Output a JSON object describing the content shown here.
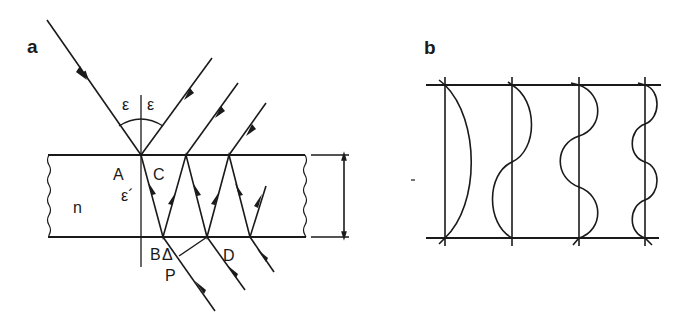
{
  "figure": {
    "panel_a": {
      "label": "a",
      "angle_incident": "ε",
      "angle_reflected": "ε",
      "angle_refracted": "ε´",
      "medium_label": "n",
      "points": {
        "A": "A",
        "B": "B",
        "C": "C",
        "D": "D",
        "P": "P",
        "delta": "Δ"
      }
    },
    "panel_b": {
      "label": "b",
      "modes": [
        {
          "name": "mode-1",
          "half_waves": 1
        },
        {
          "name": "mode-2",
          "half_waves": 2
        },
        {
          "name": "mode-3",
          "half_waves": 3
        },
        {
          "name": "mode-4",
          "half_waves": 4
        }
      ]
    },
    "colors": {
      "ink": "#1a1a1a",
      "background": "#ffffff"
    }
  }
}
